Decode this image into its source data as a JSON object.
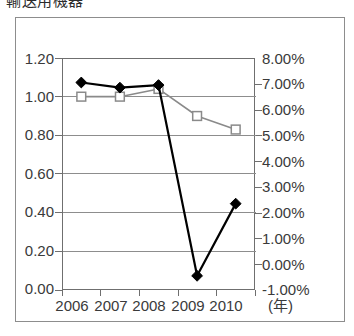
{
  "chart_data": {
    "type": "line",
    "title": "輸送用機器",
    "xlabel": "(年)",
    "categories": [
      "2006",
      "2007",
      "2008",
      "2009",
      "2010"
    ],
    "grid": true,
    "legend": "none",
    "axes": {
      "left": {
        "ylabel": "",
        "ylim": [
          0.0,
          1.2
        ],
        "tick_step": 0.2,
        "tick_labels": [
          "0.00",
          "0.20",
          "0.40",
          "0.60",
          "0.80",
          "1.00",
          "1.20"
        ],
        "tick_values": [
          0.0,
          0.2,
          0.4,
          0.6,
          0.8,
          1.0,
          1.2
        ]
      },
      "right": {
        "ylabel": "",
        "ylim": [
          -1.0,
          8.0
        ],
        "tick_step": 1.0,
        "tick_labels": [
          "-1.00%",
          "0.00%",
          "1.00%",
          "2.00%",
          "3.00%",
          "4.00%",
          "5.00%",
          "6.00%",
          "7.00%",
          "8.00%"
        ],
        "tick_values": [
          -1.0,
          0.0,
          1.0,
          2.0,
          3.0,
          4.0,
          5.0,
          6.0,
          7.0,
          8.0
        ]
      }
    },
    "series": [
      {
        "name": "black-diamond-series",
        "axis": "right",
        "marker": "diamond",
        "marker_fill": "#000000",
        "line_color": "#000000",
        "values": [
          7.05,
          6.85,
          6.95,
          -0.45,
          2.35
        ]
      },
      {
        "name": "white-square-series",
        "axis": "left",
        "marker": "square",
        "marker_fill": "#ffffff",
        "line_color": "#8a8a8a",
        "values": [
          1.0,
          1.0,
          1.04,
          0.9,
          0.83
        ]
      }
    ]
  },
  "colors": {
    "frame": "#8d8d8d",
    "axis": "#6f6f6f",
    "grid": "#8d8d8d",
    "series_dark": "#000000",
    "series_gray": "#8a8a8a",
    "background": "#ffffff",
    "text": "#3a3a3a"
  }
}
